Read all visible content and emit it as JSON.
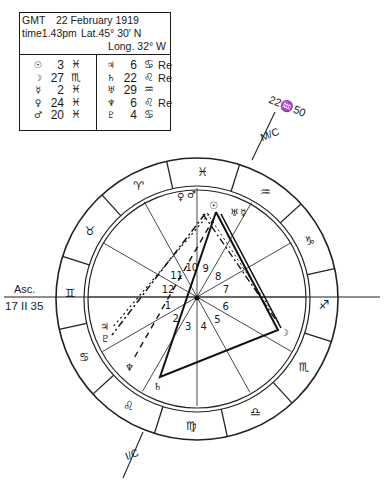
{
  "header": {
    "gmt_label": "GMT",
    "date": "22 February 1919",
    "time_label": "time",
    "time": "1.43pm",
    "latitude": "Lat.45° 30′ N",
    "longitude": "Long. 32° W"
  },
  "positions_left": [
    {
      "planet": "sun",
      "glyph": "☉",
      "degree": "3",
      "sign": "♓",
      "retro": ""
    },
    {
      "planet": "moon",
      "glyph": "☽",
      "degree": "27",
      "sign": "♏",
      "retro": ""
    },
    {
      "planet": "mercury",
      "glyph": "☿",
      "degree": "2",
      "sign": "♓",
      "retro": ""
    },
    {
      "planet": "venus",
      "glyph": "♀",
      "degree": "24",
      "sign": "♓",
      "retro": ""
    },
    {
      "planet": "mars",
      "glyph": "♂",
      "degree": "20",
      "sign": "♓",
      "retro": ""
    }
  ],
  "positions_right": [
    {
      "planet": "jupiter",
      "glyph": "♃",
      "degree": "6",
      "sign": "♋",
      "retro": "Re"
    },
    {
      "planet": "saturn",
      "glyph": "♄",
      "degree": "22",
      "sign": "♌",
      "retro": "Re"
    },
    {
      "planet": "uranus",
      "glyph": "♅",
      "degree": "29",
      "sign": "♒",
      "retro": ""
    },
    {
      "planet": "neptune",
      "glyph": "♆",
      "degree": "6",
      "sign": "♌",
      "retro": "Re"
    },
    {
      "planet": "pluto",
      "glyph": "♇",
      "degree": "4",
      "sign": "♋",
      "retro": ""
    }
  ],
  "angles": {
    "asc_label": "Asc.",
    "asc_value": "17 II 35",
    "mc_label": "M/C",
    "mc_value": "22♒50",
    "ic_label": "I/C"
  },
  "zodiac_ring": [
    "♈",
    "♉",
    "♊",
    "♋",
    "♌",
    "♍",
    "♎",
    "♏",
    "♐",
    "♑",
    "♒",
    "♓"
  ],
  "house_numbers": [
    "1",
    "2",
    "3",
    "4",
    "5",
    "6",
    "7",
    "8",
    "9",
    "10",
    "11",
    "12"
  ],
  "chart_glyphs": {
    "sun": "☉",
    "moon": "☽",
    "mercury": "☿",
    "venus": "♀",
    "mars": "♂",
    "jupiter": "♃",
    "saturn": "♄",
    "uranus": "♅",
    "neptune": "♆",
    "pluto": "♇"
  }
}
